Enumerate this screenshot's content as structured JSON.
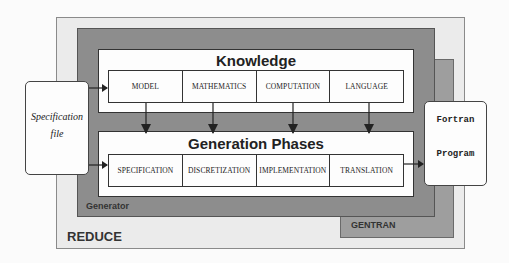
{
  "diagram": {
    "outer": {
      "label": "REDUCE"
    },
    "gentran": {
      "label": "GENTRAN"
    },
    "generator": {
      "label": "Generator"
    },
    "knowledge": {
      "title": "Knowledge",
      "cells": [
        "MODEL",
        "MATHEMATICS",
        "COMPUTATION",
        "LANGUAGE"
      ]
    },
    "phases": {
      "title": "Generation Phases",
      "cells": [
        "SPECIFICATION",
        "DISCRETIZATION",
        "IMPLEMENTATION",
        "TRANSLATION"
      ]
    },
    "input": {
      "line1": "Specification",
      "line2": "file"
    },
    "output": {
      "line1": "Fortran",
      "line2": "Program"
    },
    "edges": [
      {
        "from": "Specification file",
        "to": "MODEL"
      },
      {
        "from": "Specification file",
        "to": "SPECIFICATION"
      },
      {
        "from": "MODEL",
        "to": "SPECIFICATION"
      },
      {
        "from": "MATHEMATICS",
        "to": "DISCRETIZATION"
      },
      {
        "from": "COMPUTATION",
        "to": "IMPLEMENTATION"
      },
      {
        "from": "LANGUAGE",
        "to": "TRANSLATION"
      },
      {
        "from": "TRANSLATION",
        "to": "Fortran Program"
      }
    ]
  },
  "colors": {
    "reduce_bg": "#ebebeb",
    "generator_bg": "#8d8d8d",
    "gentran_bg": "#9e9e9e",
    "box_bg": "#fdfdfd"
  }
}
